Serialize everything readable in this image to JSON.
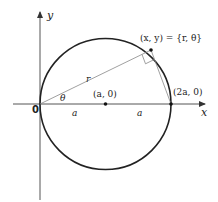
{
  "diagram": {
    "title": "",
    "axes": {
      "x_label": "x",
      "y_label": "y",
      "origin_label": "0"
    },
    "angle_label": "θ",
    "radius_label": "r",
    "center_label": "(a, 0)",
    "diameter_end_label": "(2a, 0)",
    "segment_label_left": "a",
    "segment_label_right": "a",
    "point_label": "(x, y) = {r, θ}",
    "colors": {
      "circle": "#222222",
      "axes": "#444444",
      "thin_lines": "#777777",
      "text": "#222222"
    }
  }
}
